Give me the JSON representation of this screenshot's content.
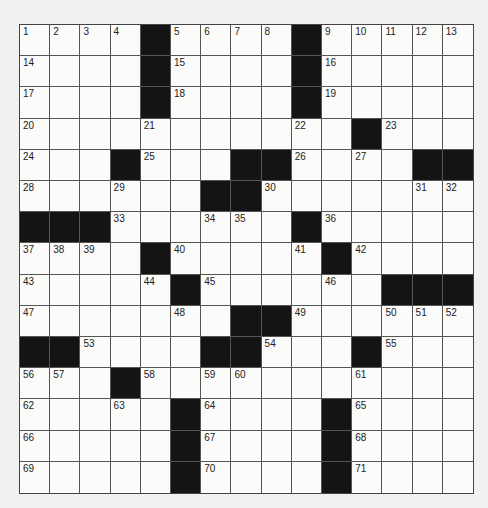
{
  "puzzle": {
    "size": 15,
    "colors": {
      "block": "#141414",
      "cell": "#fbfbfa",
      "line": "#555555",
      "background": "#f1f1f0"
    },
    "rows": [
      [
        "1",
        "2",
        "3",
        "4",
        "#",
        "5",
        "6",
        "7",
        "8",
        "#",
        "9",
        "10",
        "11",
        "12",
        "13"
      ],
      [
        "14",
        "",
        "",
        "",
        "#",
        "15",
        "",
        "",
        "",
        "#",
        "16",
        "",
        "",
        "",
        ""
      ],
      [
        "17",
        "",
        "",
        "",
        "#",
        "18",
        "",
        "",
        "",
        "#",
        "19",
        "",
        "",
        "",
        ""
      ],
      [
        "20",
        "",
        "",
        "",
        "21",
        "",
        "",
        "",
        "",
        "22",
        "",
        "#",
        "23",
        "",
        ""
      ],
      [
        "24",
        "",
        "",
        "#",
        "25",
        "",
        "",
        "#",
        "#",
        "26",
        "",
        "27",
        "",
        "#",
        "#"
      ],
      [
        "28",
        "",
        "",
        "29",
        "",
        "",
        "#",
        "#",
        "30",
        "",
        "",
        "",
        "",
        "31",
        "32"
      ],
      [
        "#",
        "#",
        "#",
        "33",
        "",
        "",
        "34",
        "35",
        "",
        "#",
        "36",
        "",
        "",
        "",
        ""
      ],
      [
        "37",
        "38",
        "39",
        "",
        "#",
        "40",
        "",
        "",
        "",
        "41",
        "#",
        "42",
        "",
        "",
        ""
      ],
      [
        "43",
        "",
        "",
        "",
        "44",
        "#",
        "45",
        "",
        "",
        "",
        "46",
        "",
        "#",
        "#",
        "#"
      ],
      [
        "47",
        "",
        "",
        "",
        "",
        "48",
        "",
        "#",
        "#",
        "49",
        "",
        "",
        "50",
        "51",
        "52"
      ],
      [
        "#",
        "#",
        "53",
        "",
        "",
        "",
        "#",
        "#",
        "54",
        "",
        "",
        "#",
        "55",
        "",
        ""
      ],
      [
        "56",
        "57",
        "",
        "#",
        "58",
        "",
        "59",
        "60",
        "",
        "",
        "",
        "61",
        "",
        "",
        ""
      ],
      [
        "62",
        "",
        "",
        "63",
        "",
        "#",
        "64",
        "",
        "",
        "",
        "#",
        "65",
        "",
        "",
        ""
      ],
      [
        "66",
        "",
        "",
        "",
        "",
        "#",
        "67",
        "",
        "",
        "",
        "#",
        "68",
        "",
        "",
        ""
      ],
      [
        "69",
        "",
        "",
        "",
        "",
        "#",
        "70",
        "",
        "",
        "",
        "#",
        "71",
        "",
        "",
        ""
      ]
    ]
  }
}
